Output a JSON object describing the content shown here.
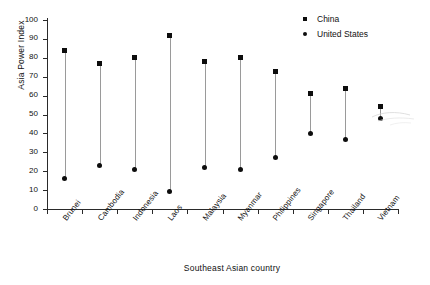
{
  "chart_data": {
    "type": "scatter",
    "title": "",
    "xlabel": "Southeast Asian country",
    "ylabel": "Asia Power Index",
    "ylim": [
      0,
      100
    ],
    "yticks": [
      0,
      10,
      20,
      30,
      40,
      50,
      60,
      70,
      80,
      90,
      100
    ],
    "grid": false,
    "legend_position": "top-right",
    "categories": [
      "Brunei",
      "Cambodia",
      "Indonesia",
      "Laos",
      "Malaysia",
      "Myanmar",
      "Philippines",
      "Singapore",
      "Thailand",
      "Vietnam"
    ],
    "series": [
      {
        "name": "China",
        "marker": "square",
        "color": "#0d0d0d",
        "values": [
          84,
          77,
          80,
          92,
          78,
          80,
          73,
          61,
          64,
          54
        ]
      },
      {
        "name": "United States",
        "marker": "circle",
        "color": "#0d0d0d",
        "values": [
          16,
          23,
          21,
          9,
          22,
          21,
          27,
          40,
          37,
          48
        ]
      }
    ]
  },
  "legend": {
    "entries": [
      {
        "label": "China",
        "marker": "square"
      },
      {
        "label": "United States",
        "marker": "circle"
      }
    ]
  }
}
